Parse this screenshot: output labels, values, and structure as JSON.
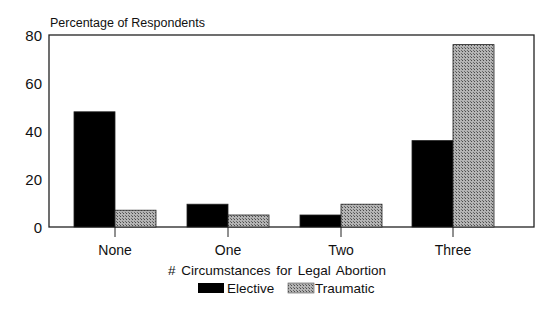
{
  "chart_data": {
    "type": "bar",
    "title": "",
    "ylabel": "Percentage of Respondents",
    "xlabel": "# Circumstances for Legal Abortion",
    "categories": [
      "None",
      "One",
      "Two",
      "Three"
    ],
    "series": [
      {
        "name": "Elective",
        "values": [
          48,
          9.5,
          5,
          36
        ],
        "color": "#000000"
      },
      {
        "name": "Traumatic",
        "values": [
          7,
          5,
          9.5,
          76
        ],
        "color": "#9a9a9a",
        "pattern": "stipple"
      }
    ],
    "yticks": [
      0,
      20,
      40,
      60,
      80
    ],
    "ylim": [
      0,
      80
    ],
    "grid": false,
    "legend_position": "bottom"
  }
}
